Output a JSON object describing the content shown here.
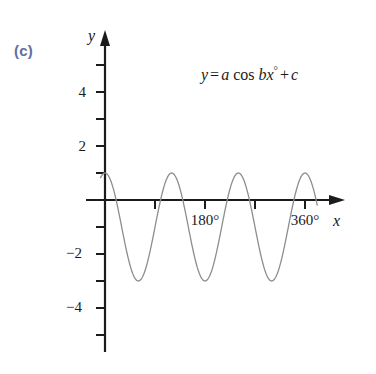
{
  "figure": {
    "part_label": "(c)",
    "part_label_color": "#5f6fa0",
    "equation": {
      "lhs": "y",
      "equals": "=",
      "coef_a": "a",
      "func": "cos",
      "coef_b": "b",
      "variable": "x",
      "degree": "°",
      "plus": "+",
      "coef_c": "c",
      "full": "y = a cos bx° + c"
    },
    "axis_names": {
      "x": "x",
      "y": "y"
    },
    "curve_color": "#8d8d8d",
    "axis_color": "#1b1b1b",
    "background": "#ffffff"
  },
  "chart_data": {
    "type": "line",
    "title": "",
    "subtitle": "",
    "xlabel": "x",
    "ylabel": "y",
    "xlim": [
      -20,
      420
    ],
    "ylim": [
      -5.2,
      5.4
    ],
    "grid": false,
    "legend": null,
    "annotations": [
      {
        "text": "(c)",
        "x": -95,
        "y": 4.6
      },
      {
        "text": "y = a cos bx° + c",
        "x": 180,
        "y": 4.2
      }
    ],
    "x_ticks": [
      0,
      60,
      120,
      180,
      240,
      300,
      360,
      420
    ],
    "x_tick_labels": [
      "",
      "",
      "",
      "180°",
      "",
      "",
      "360°",
      ""
    ],
    "y_ticks": [
      -5,
      -4,
      -3,
      -2,
      -1,
      0,
      1,
      2,
      3,
      4,
      5
    ],
    "y_tick_labels": [
      "",
      "−4",
      "",
      "−2",
      "",
      "",
      "",
      "2",
      "",
      "4",
      ""
    ],
    "series": [
      {
        "name": "y = 2 cos 3x° − 1",
        "equation": "y = a cos bx° + c",
        "parameters": {
          "a": 2,
          "b": 3,
          "c": -1
        },
        "amplitude": 2,
        "period_degrees": 120,
        "maximum": 1,
        "minimum": -3,
        "color": "#8d8d8d",
        "x": [
          0,
          10,
          20,
          30,
          40,
          50,
          60,
          70,
          80,
          90,
          100,
          110,
          120,
          130,
          140,
          150,
          160,
          170,
          180,
          190,
          200,
          210,
          220,
          230,
          240,
          250,
          260,
          270,
          280,
          290,
          300,
          310,
          320,
          330,
          340,
          350,
          360,
          370,
          380
        ],
        "values": [
          1,
          0.73,
          0,
          -1,
          -2,
          -2.73,
          -3,
          -2.73,
          -2,
          -1,
          0,
          0.73,
          1,
          0.73,
          0,
          -1,
          -2,
          -2.73,
          -3,
          -2.73,
          -2,
          -1,
          0,
          0.73,
          1,
          0.73,
          0,
          -1,
          -2,
          -2.73,
          -3,
          -2.73,
          -2,
          -1,
          0,
          0.73,
          1,
          0.73,
          0
        ]
      }
    ]
  }
}
